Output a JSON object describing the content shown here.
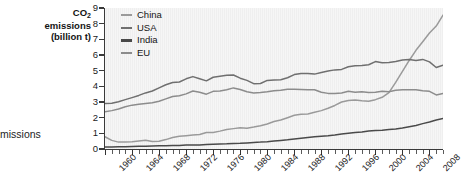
{
  "figure": {
    "caption_fragment": "missions",
    "y_axis_title_line1": "CO",
    "y_axis_title_sub": "2",
    "y_axis_title_line2": "emissions",
    "y_axis_title_line3": "(billion t)"
  },
  "legend": {
    "position": "top-left-inside",
    "entries": [
      {
        "label": "China",
        "color": "#9a9a9a"
      },
      {
        "label": "USA",
        "color": "#6f6f6f"
      },
      {
        "label": "India",
        "color": "#4a4a4a"
      },
      {
        "label": "EU",
        "color": "#8c8c8c"
      }
    ]
  },
  "axes": {
    "y_ticks": [
      "0",
      "1",
      "2",
      "3",
      "4",
      "5",
      "6",
      "7",
      "8",
      "9"
    ],
    "x_ticks": [
      "1960",
      "1964",
      "1968",
      "1972",
      "1976",
      "1980",
      "1984",
      "1988",
      "1992",
      "1996",
      "2000",
      "2004",
      "2008"
    ]
  },
  "chart_data": {
    "type": "line",
    "title": "",
    "xlabel": "",
    "ylabel": "CO2 emissions (billion t)",
    "xlim": [
      1960,
      2010
    ],
    "ylim": [
      0,
      9
    ],
    "grid": "vertical-faint",
    "legend_position": "top-left-inside",
    "x": [
      1960,
      1961,
      1962,
      1963,
      1964,
      1965,
      1966,
      1967,
      1968,
      1969,
      1970,
      1971,
      1972,
      1973,
      1974,
      1975,
      1976,
      1977,
      1978,
      1979,
      1980,
      1981,
      1982,
      1983,
      1984,
      1985,
      1986,
      1987,
      1988,
      1989,
      1990,
      1991,
      1992,
      1993,
      1994,
      1995,
      1996,
      1997,
      1998,
      1999,
      2000,
      2001,
      2002,
      2003,
      2004,
      2005,
      2006,
      2007,
      2008,
      2009,
      2010
    ],
    "series": [
      {
        "name": "China",
        "color": "#9a9a9a",
        "values": [
          0.78,
          0.55,
          0.44,
          0.44,
          0.47,
          0.51,
          0.56,
          0.48,
          0.5,
          0.6,
          0.73,
          0.81,
          0.85,
          0.9,
          0.92,
          1.05,
          1.05,
          1.14,
          1.25,
          1.3,
          1.35,
          1.33,
          1.4,
          1.48,
          1.6,
          1.75,
          1.85,
          2.0,
          2.15,
          2.22,
          2.24,
          2.35,
          2.45,
          2.6,
          2.78,
          3.0,
          3.1,
          3.12,
          3.08,
          3.05,
          3.15,
          3.3,
          3.6,
          4.25,
          4.95,
          5.65,
          6.3,
          6.85,
          7.4,
          7.85,
          8.55
        ]
      },
      {
        "name": "USA",
        "color": "#6f6f6f",
        "values": [
          2.9,
          2.92,
          3.02,
          3.15,
          3.28,
          3.42,
          3.58,
          3.7,
          3.9,
          4.1,
          4.25,
          4.28,
          4.48,
          4.62,
          4.48,
          4.35,
          4.58,
          4.65,
          4.7,
          4.72,
          4.52,
          4.38,
          4.17,
          4.18,
          4.38,
          4.4,
          4.42,
          4.55,
          4.75,
          4.82,
          4.82,
          4.78,
          4.88,
          4.98,
          5.05,
          5.08,
          5.25,
          5.32,
          5.33,
          5.38,
          5.58,
          5.5,
          5.52,
          5.58,
          5.68,
          5.72,
          5.65,
          5.72,
          5.56,
          5.2,
          5.35
        ]
      },
      {
        "name": "EU",
        "color": "#8c8c8c",
        "values": [
          2.38,
          2.45,
          2.55,
          2.7,
          2.8,
          2.85,
          2.9,
          2.95,
          3.05,
          3.2,
          3.35,
          3.4,
          3.52,
          3.7,
          3.62,
          3.5,
          3.68,
          3.7,
          3.78,
          3.9,
          3.8,
          3.65,
          3.58,
          3.6,
          3.65,
          3.72,
          3.75,
          3.82,
          3.82,
          3.8,
          3.78,
          3.78,
          3.62,
          3.55,
          3.55,
          3.58,
          3.68,
          3.62,
          3.65,
          3.6,
          3.62,
          3.68,
          3.66,
          3.75,
          3.78,
          3.78,
          3.78,
          3.72,
          3.68,
          3.45,
          3.55
        ]
      },
      {
        "name": "India",
        "color": "#4a4a4a",
        "values": [
          0.12,
          0.13,
          0.14,
          0.15,
          0.16,
          0.17,
          0.18,
          0.19,
          0.2,
          0.21,
          0.22,
          0.23,
          0.25,
          0.25,
          0.26,
          0.28,
          0.3,
          0.32,
          0.33,
          0.35,
          0.36,
          0.39,
          0.42,
          0.44,
          0.47,
          0.51,
          0.55,
          0.59,
          0.64,
          0.69,
          0.73,
          0.78,
          0.82,
          0.85,
          0.9,
          0.96,
          1.0,
          1.05,
          1.08,
          1.15,
          1.18,
          1.2,
          1.24,
          1.28,
          1.34,
          1.42,
          1.5,
          1.62,
          1.72,
          1.85,
          1.95
        ]
      }
    ]
  }
}
